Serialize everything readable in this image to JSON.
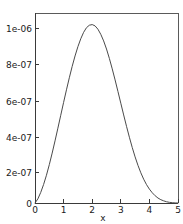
{
  "chart_data": {
    "type": "line",
    "title": "",
    "xlabel": "x",
    "ylabel": "",
    "xlim": [
      0,
      5
    ],
    "ylim": [
      0,
      1.15e-06
    ],
    "grid": false,
    "legend": null,
    "xticks": [
      0,
      1,
      2,
      3,
      4,
      5
    ],
    "xticklabels": [
      "0",
      "1",
      "2",
      "3",
      "4",
      "5"
    ],
    "yticks": [
      0,
      2e-07,
      4e-07,
      6e-07,
      8e-07,
      1e-06
    ],
    "yticklabels": [
      "0",
      "2e-07",
      "4e-07",
      "6e-07",
      "8e-07",
      "1e-06"
    ],
    "series": [
      {
        "name": "curve",
        "color": "#4a4a4a",
        "x": [
          0.0,
          0.1,
          0.2,
          0.3,
          0.4,
          0.5,
          0.6,
          0.7,
          0.8,
          0.9,
          1.0,
          1.1,
          1.2,
          1.3,
          1.4,
          1.5,
          1.6,
          1.7,
          1.8,
          1.9,
          2.0,
          2.1,
          2.2,
          2.3,
          2.4,
          2.5,
          2.6,
          2.7,
          2.8,
          2.9,
          3.0,
          3.1,
          3.2,
          3.3,
          3.4,
          3.5,
          3.6,
          3.7,
          3.8,
          3.9,
          4.0,
          4.1,
          4.2,
          4.3,
          4.4,
          4.5,
          4.6,
          4.7,
          4.8,
          4.9,
          5.0
        ],
        "y": [
          0.0,
          2.5e-08,
          6.4e-08,
          1.12e-07,
          1.68e-07,
          2.32e-07,
          3.02e-07,
          3.76e-07,
          4.53e-07,
          5.31e-07,
          6.09e-07,
          6.85e-07,
          7.58e-07,
          8.27e-07,
          8.9e-07,
          9.46e-07,
          9.94e-07,
          1.033e-06,
          1.061e-06,
          1.076e-06,
          1.08e-06,
          1.072e-06,
          1.052e-06,
          1.021e-06,
          9.81e-07,
          9.32e-07,
          8.75e-07,
          8.12e-07,
          7.45e-07,
          6.75e-07,
          6.04e-07,
          5.33e-07,
          4.64e-07,
          3.98e-07,
          3.36e-07,
          2.79e-07,
          2.28e-07,
          1.83e-07,
          1.44e-07,
          1.11e-07,
          8.4e-08,
          6.2e-08,
          4.4e-08,
          3e-08,
          2e-08,
          1.3e-08,
          7.5e-09,
          4e-09,
          1.8e-09,
          5e-10,
          0.0
        ]
      }
    ],
    "annotations": []
  },
  "axes": {
    "x_axis_title": "x",
    "y_axis_title": ""
  }
}
